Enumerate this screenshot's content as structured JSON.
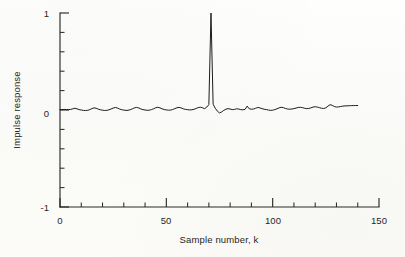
{
  "figure": {
    "name": "impulse-response-plot",
    "background_color": "#fdfdfb",
    "line_color": "#1c1c1c",
    "axis_color": "#2b2b2b"
  },
  "labels": {
    "xaxis_title": "Sample number, k",
    "yaxis_title": "Impulse response",
    "x_ticks": [
      "0",
      "50",
      "100",
      "150"
    ],
    "y_ticks": [
      "1",
      "0",
      "-1"
    ]
  },
  "chart_data": {
    "type": "line",
    "title": "",
    "xlabel": "Sample number, k",
    "ylabel": "Impulse response",
    "xlim": [
      0,
      150
    ],
    "ylim": [
      -1,
      1
    ],
    "xticks": [
      0,
      50,
      100,
      150
    ],
    "yticks": [
      -1,
      0,
      1
    ],
    "xminor_step": 10,
    "yminor_step": 0.2,
    "grid": false,
    "legend": null,
    "annotations": [
      {
        "text": "main impulse peak",
        "x": 71,
        "y": 1.0
      }
    ],
    "series": [
      {
        "name": "impulse response h[k]",
        "x": [
          0,
          1,
          2,
          3,
          4,
          5,
          6,
          7,
          8,
          9,
          10,
          11,
          12,
          13,
          14,
          15,
          16,
          17,
          18,
          19,
          20,
          21,
          22,
          23,
          24,
          25,
          26,
          27,
          28,
          29,
          30,
          31,
          32,
          33,
          34,
          35,
          36,
          37,
          38,
          39,
          40,
          41,
          42,
          43,
          44,
          45,
          46,
          47,
          48,
          49,
          50,
          51,
          52,
          53,
          54,
          55,
          56,
          57,
          58,
          59,
          60,
          61,
          62,
          63,
          64,
          65,
          66,
          67,
          68,
          69,
          70,
          71,
          72,
          73,
          74,
          75,
          76,
          77,
          78,
          79,
          80,
          81,
          82,
          83,
          84,
          85,
          86,
          87,
          88,
          89,
          90,
          91,
          92,
          93,
          94,
          95,
          96,
          97,
          98,
          99,
          100,
          101,
          102,
          103,
          104,
          105,
          106,
          107,
          108,
          109,
          110,
          111,
          112,
          113,
          114,
          115,
          116,
          117,
          118,
          119,
          120,
          121,
          122,
          123,
          124,
          125,
          126,
          127,
          128,
          129,
          130,
          131,
          132,
          133,
          134,
          135,
          136,
          137,
          138,
          139,
          140
        ],
        "y": [
          0.005,
          0.004,
          0.006,
          0.005,
          0.004,
          0.006,
          0.012,
          0.018,
          0.012,
          0.004,
          0.0,
          -0.004,
          -0.006,
          -0.003,
          0.004,
          0.014,
          0.022,
          0.018,
          0.009,
          0.002,
          -0.002,
          -0.005,
          -0.004,
          0.002,
          0.01,
          0.02,
          0.026,
          0.02,
          0.01,
          0.003,
          -0.001,
          -0.004,
          -0.003,
          0.003,
          0.012,
          0.022,
          0.027,
          0.021,
          0.011,
          0.004,
          0.0,
          -0.003,
          -0.002,
          0.004,
          0.013,
          0.023,
          0.028,
          0.022,
          0.012,
          0.005,
          0.001,
          -0.002,
          -0.001,
          0.005,
          0.014,
          0.023,
          0.027,
          0.021,
          0.012,
          0.006,
          0.003,
          0.001,
          0.002,
          0.007,
          0.016,
          0.025,
          0.029,
          0.023,
          0.014,
          0.03,
          0.055,
          1.0,
          0.06,
          0.018,
          -0.012,
          -0.03,
          -0.02,
          -0.004,
          0.008,
          0.014,
          0.01,
          0.004,
          0.006,
          0.012,
          0.01,
          0.004,
          0.002,
          0.006,
          0.04,
          0.012,
          0.008,
          0.01,
          0.018,
          0.026,
          0.022,
          0.014,
          0.008,
          0.004,
          0.0,
          -0.004,
          -0.002,
          0.004,
          0.012,
          0.022,
          0.028,
          0.024,
          0.016,
          0.01,
          0.008,
          0.01,
          0.014,
          0.02,
          0.026,
          0.028,
          0.024,
          0.018,
          0.014,
          0.016,
          0.022,
          0.03,
          0.034,
          0.03,
          0.024,
          0.018,
          0.016,
          0.022,
          0.04,
          0.055,
          0.048,
          0.036,
          0.03,
          0.032,
          0.036,
          0.04,
          0.042,
          0.043,
          0.044,
          0.045,
          0.046,
          0.046,
          0.046
        ]
      }
    ]
  }
}
